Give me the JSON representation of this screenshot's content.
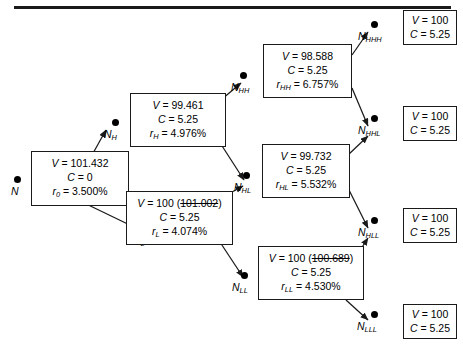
{
  "figure": {
    "type": "binomial-interest-rate-tree",
    "rule_present": true
  },
  "labels": {
    "root": "N",
    "h": "N",
    "h_sub": "H",
    "l": "N",
    "l_sub": "L",
    "hh": "N",
    "hh_sub": "HH",
    "hl": "N",
    "hl_sub": "HL",
    "ll": "N",
    "ll_sub": "LL",
    "hhh": "N",
    "hhh_sub": "HHH",
    "hhl": "N",
    "hhl_sub": "HHL",
    "hll": "N",
    "hll_sub": "HLL",
    "lll": "N",
    "lll_sub": "LLL"
  },
  "nodes": {
    "root": {
      "v_label": "V",
      "v_value": "101.432",
      "c_label": "C",
      "c_value": "0",
      "r_label": "r",
      "r_sub": "0",
      "r_value": "3.500%",
      "struck_value": ""
    },
    "h": {
      "v_label": "V",
      "v_value": "99.461",
      "c_label": "C",
      "c_value": "5.25",
      "r_label": "r",
      "r_sub": "H",
      "r_value": "4.976%",
      "struck_value": ""
    },
    "l": {
      "v_label": "V",
      "v_value": "100",
      "c_label": "C",
      "c_value": "5.25",
      "r_label": "r",
      "r_sub": "L",
      "r_value": "4.074%",
      "struck_value": "101.002"
    },
    "hh": {
      "v_label": "V",
      "v_value": "98.588",
      "c_label": "C",
      "c_value": "5.25",
      "r_label": "r",
      "r_sub": "HH",
      "r_value": "6.757%",
      "struck_value": ""
    },
    "hl": {
      "v_label": "V",
      "v_value": "99.732",
      "c_label": "C",
      "c_value": "5.25",
      "r_label": "r",
      "r_sub": "HL",
      "r_value": "5.532%",
      "struck_value": ""
    },
    "ll": {
      "v_label": "V",
      "v_value": "100",
      "c_label": "C",
      "c_value": "5.25",
      "r_label": "r",
      "r_sub": "LL",
      "r_value": "4.530%",
      "struck_value": "100.689"
    },
    "hhh": {
      "v_label": "V",
      "v_value": "100",
      "c_label": "C",
      "c_value": "5.25"
    },
    "hhl": {
      "v_label": "V",
      "v_value": "100",
      "c_label": "C",
      "c_value": "5.25"
    },
    "hll": {
      "v_label": "V",
      "v_value": "100",
      "c_label": "C",
      "c_value": "5.25"
    },
    "lll": {
      "v_label": "V",
      "v_value": "100",
      "c_label": "C",
      "c_value": "5.25"
    }
  },
  "symbols": {
    "equals": "=",
    "paren_open": "(",
    "paren_close": ")"
  },
  "colors": {
    "stroke": "#1a1a1a",
    "text": "#000000",
    "background": "#ffffff"
  }
}
